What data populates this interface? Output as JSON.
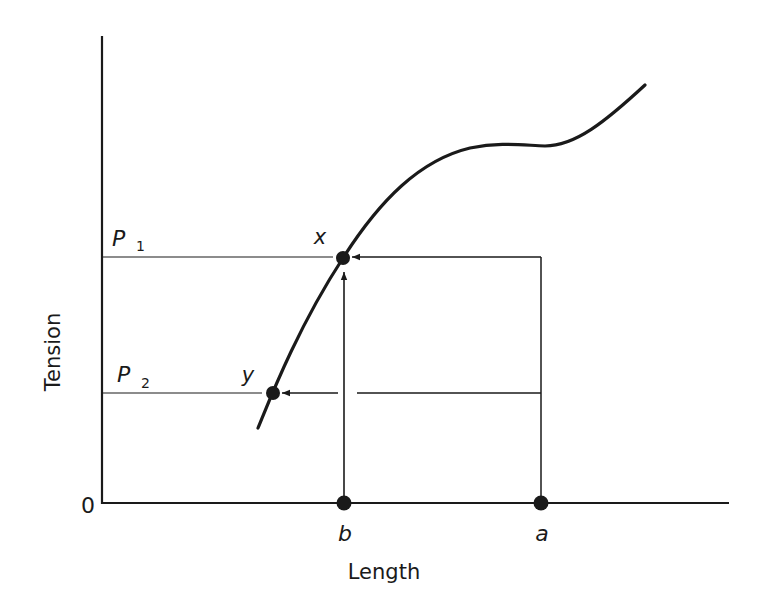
{
  "diagram": {
    "axes": {
      "y_label": "Tension",
      "x_label": "Length",
      "origin_label": "0"
    },
    "levels": [
      {
        "name": "P",
        "sub": "1"
      },
      {
        "name": "P",
        "sub": "2"
      }
    ],
    "points": {
      "x": "x",
      "y": "y",
      "a": "a",
      "b": "b"
    },
    "colors": {
      "ink": "#1a1a1a",
      "background": "#ffffff"
    }
  }
}
